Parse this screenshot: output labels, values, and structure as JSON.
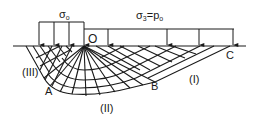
{
  "diagram": {
    "type": "slip-line field (Prandtl bearing capacity mechanism)",
    "labels": {
      "surcharge_left": "σ",
      "surcharge_left_sub": "o",
      "surcharge_right": "σ",
      "surcharge_right_sub": "3",
      "surcharge_right_eq": "=p",
      "surcharge_right_eq_sub": "o",
      "point_O": "O",
      "point_A": "A",
      "point_B": "B",
      "point_C": "C",
      "zone_I": "(I)",
      "zone_II": "(II)",
      "zone_III": "(III)"
    },
    "colors": {
      "line": "#1a1a1a",
      "background": "#ffffff"
    }
  }
}
